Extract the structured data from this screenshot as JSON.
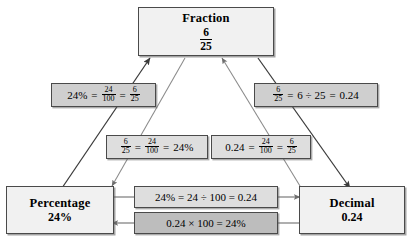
{
  "diagram": {
    "colors": {
      "node_fill": "#f1f1f1",
      "label_fill": "#cfcfcf",
      "label_fill_dark": "#bdbdbd",
      "border": "#4a4a4a",
      "arrow": "#3a3a3a",
      "background": "#ffffff"
    }
  },
  "nodes": {
    "fraction": {
      "title": "Fraction",
      "numerator": "6",
      "denominator": "25"
    },
    "percentage": {
      "title": "Percentage",
      "value": "24%"
    },
    "decimal": {
      "title": "Decimal",
      "value": "0.24"
    }
  },
  "labels": {
    "percent_to_fraction": {
      "text": "24% = 24/100 = 6/25",
      "lead": "24%",
      "eq1": "=",
      "frac1_num": "24",
      "frac1_den": "100",
      "eq2": "=",
      "frac2_num": "6",
      "frac2_den": "25"
    },
    "fraction_to_decimal": {
      "text": "6/25 = 6 ÷ 25 = 0.24",
      "frac1_num": "6",
      "frac1_den": "25",
      "eq1": "=",
      "mid": "6 ÷ 25",
      "eq2": "=",
      "result": "0.24"
    },
    "fraction_to_percent": {
      "text": "6/25 = 24/100 = 24%",
      "frac1_num": "6",
      "frac1_den": "25",
      "eq1": "=",
      "frac2_num": "24",
      "frac2_den": "100",
      "eq2": "=",
      "result": "24%"
    },
    "decimal_to_fraction": {
      "text": "0.24 = 24/100 = 6/25",
      "lead": "0.24",
      "eq1": "=",
      "frac1_num": "24",
      "frac1_den": "100",
      "eq2": "=",
      "frac2_num": "6",
      "frac2_den": "25"
    },
    "percent_to_decimal": {
      "text": "24% = 24 ÷ 100 = 0.24"
    },
    "decimal_to_percent": {
      "text": "0.24 × 100 = 24%"
    }
  }
}
